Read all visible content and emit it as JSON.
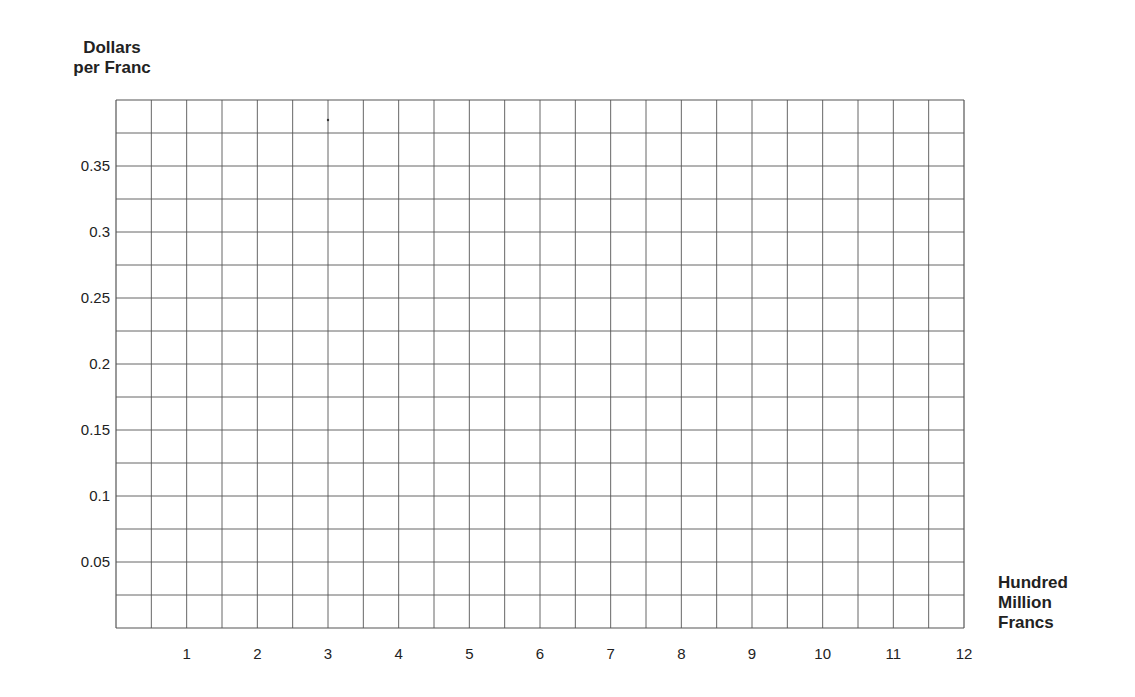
{
  "chart_data": {
    "type": "line",
    "title": "",
    "ylabel_lines": [
      "Dollars",
      "per Franc"
    ],
    "xlabel_lines": [
      "Hundred",
      "Million",
      "Francs"
    ],
    "x_ticks": [
      "1",
      "2",
      "3",
      "4",
      "5",
      "6",
      "7",
      "8",
      "9",
      "10",
      "11",
      "12"
    ],
    "y_ticks": [
      "0.05",
      "0.1",
      "0.15",
      "0.2",
      "0.25",
      "0.3",
      "0.35"
    ],
    "xlim": [
      0,
      12
    ],
    "ylim": [
      0,
      0.4
    ],
    "x_minor_step": 0.5,
    "y_minor_step": 0.025,
    "grid": true,
    "series": [],
    "grid_color": "#555555"
  }
}
